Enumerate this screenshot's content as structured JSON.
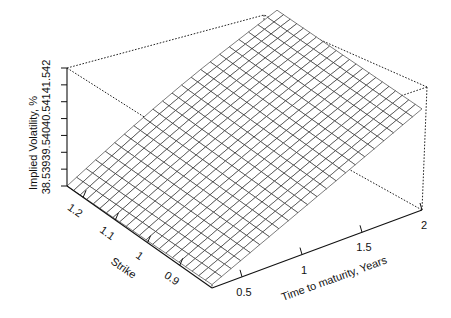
{
  "chart_data": {
    "type": "surface3d",
    "title": "",
    "xlabel": "Time to maturity, Years",
    "ylabel": "Strike",
    "zlabel": "Implied Volatility, %",
    "x_ticks": [
      "0.5",
      "1",
      "1.5",
      "2"
    ],
    "y_ticks": [
      "0.9",
      "1",
      "1.1",
      "1.2"
    ],
    "z_ticks": [
      "38.5",
      "39",
      "39.5",
      "40",
      "40.5",
      "41",
      "41.5",
      "42"
    ],
    "xlim": [
      0.25,
      2.0
    ],
    "ylim": [
      0.8,
      1.25
    ],
    "zlim": [
      38.5,
      42.0
    ],
    "grid": false,
    "box": "dotted",
    "surface_description": "Nearly planar wireframe surface; volatility rises with time to maturity from about 38.5% at short maturity / high strike to about 41.5% at 2 years, with little strike dependence.",
    "corner_values": [
      {
        "time": 0.25,
        "strike": 1.25,
        "vol": 38.5
      },
      {
        "time": 0.25,
        "strike": 0.8,
        "vol": 38.6
      },
      {
        "time": 2.0,
        "strike": 1.25,
        "vol": 41.4
      },
      {
        "time": 2.0,
        "strike": 0.8,
        "vol": 41.5
      }
    ],
    "mesh_rows": 22,
    "mesh_cols": 22
  },
  "labels": {
    "z_axis_title": "Implied Volatility, %",
    "y_axis_title": "Strike",
    "x_axis_title": "Time to maturity, Years"
  }
}
